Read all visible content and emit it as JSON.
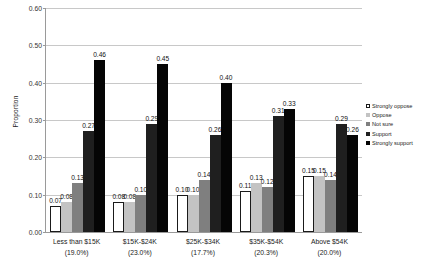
{
  "chart_data": {
    "type": "bar",
    "title": "",
    "xlabel": "",
    "ylabel": "Proportion",
    "ylim": [
      0.0,
      0.6
    ],
    "ytick_step": 0.1,
    "ytick_labels": [
      "0.60",
      "0.50",
      "0.40",
      "0.30",
      "0.20",
      "0.10",
      "0.00"
    ],
    "ytick_values": [
      0.6,
      0.5,
      0.4,
      0.3,
      0.2,
      0.1,
      0.0
    ],
    "grid": true,
    "legend_position": "right",
    "categories": [
      "Less than $15K\n(19.0%)",
      "$15K-$24K\n(23.0%)",
      "$25K-$34K\n(17.7%)",
      "$35K-$54K\n(20.3%)",
      "Above $54K\n(20.0%)"
    ],
    "category_labels": [
      {
        "line1": "Less than $15K",
        "line2": "(19.0%)"
      },
      {
        "line1": "$15K-$24K",
        "line2": "(23.0%)"
      },
      {
        "line1": "$25K-$34K",
        "line2": "(17.7%)"
      },
      {
        "line1": "$35K-$54K",
        "line2": "(20.3%)"
      },
      {
        "line1": "Above $54K",
        "line2": "(20.0%)"
      }
    ],
    "series": [
      {
        "name": "Strongly oppose",
        "color": "#ffffff",
        "values": [
          0.07,
          0.08,
          0.1,
          0.11,
          0.15
        ],
        "labels": [
          "0.07",
          "0.08",
          "0.10",
          "0.11",
          "0.15"
        ]
      },
      {
        "name": "Oppose",
        "color": "#c3c3c3",
        "values": [
          0.08,
          0.08,
          0.1,
          0.13,
          0.15
        ],
        "labels": [
          "0.08",
          "0.08",
          "0.10",
          "0.13",
          "0.15"
        ]
      },
      {
        "name": "Not sure",
        "color": "#7f7f7f",
        "values": [
          0.13,
          0.1,
          0.14,
          0.12,
          0.14
        ],
        "labels": [
          "0.13",
          "0.10",
          "0.14",
          "0.12",
          "0.14"
        ]
      },
      {
        "name": "Support",
        "color": "#1f1f1f",
        "values": [
          0.27,
          0.29,
          0.26,
          0.31,
          0.29
        ],
        "labels": [
          "0.27",
          "0.29",
          "0.26",
          "0.31",
          "0.29"
        ]
      },
      {
        "name": "Strongly support",
        "color": "#050505",
        "values": [
          0.46,
          0.45,
          0.4,
          0.33,
          0.26
        ],
        "labels": [
          "0.46",
          "0.45",
          "0.40",
          "0.33",
          "0.26"
        ]
      }
    ]
  }
}
